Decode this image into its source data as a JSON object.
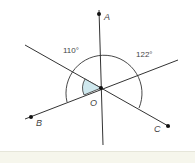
{
  "diagram": {
    "points": {
      "A": "A",
      "B": "B",
      "C": "C",
      "O": "O"
    },
    "angles": {
      "left": "110°",
      "right": "122°"
    },
    "colors": {
      "line": "#333333",
      "shade": "#cfe8ee"
    }
  }
}
